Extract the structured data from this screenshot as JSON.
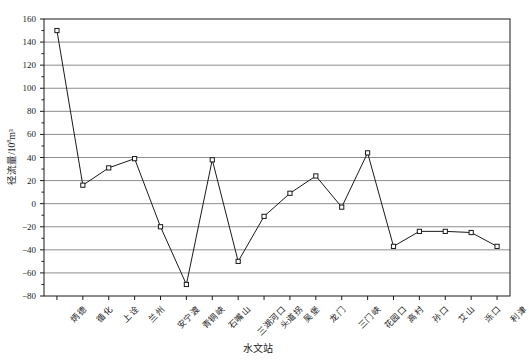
{
  "chart_data": {
    "type": "line",
    "title": "",
    "xlabel": "水文站",
    "ylabel": "径流量/10⁸m³",
    "ylabel_main": "径流量/10",
    "ylabel_exp": "8",
    "ylabel_unit": "m³",
    "ylim": [
      -80,
      160
    ],
    "ytick_labels": [
      "160",
      "140",
      "120",
      "100",
      "80",
      "60",
      "40",
      "20",
      "0",
      "−20",
      "−40",
      "−60",
      "−80"
    ],
    "ytick_values": [
      160,
      140,
      120,
      100,
      80,
      60,
      40,
      20,
      0,
      -20,
      -40,
      -60,
      -80
    ],
    "grid": true,
    "legend": "none",
    "marker": "open-square",
    "line_color": "#1a1a1a",
    "grid_color": "#808080",
    "categories": [
      "炳德",
      "循化",
      "上诠",
      "兰州",
      "安宁渡",
      "青铜峡",
      "石嘴山",
      "三湖河口",
      "头道拐",
      "吴堡",
      "龙门",
      "三门峡",
      "花园口",
      "高村",
      "孙口",
      "艾山",
      "泺口",
      "利津"
    ],
    "values": [
      150,
      16,
      31,
      39,
      -20,
      -70,
      38,
      -50,
      -11,
      9,
      24,
      -3,
      44,
      -37,
      -24,
      -24,
      -25,
      -37
    ]
  }
}
